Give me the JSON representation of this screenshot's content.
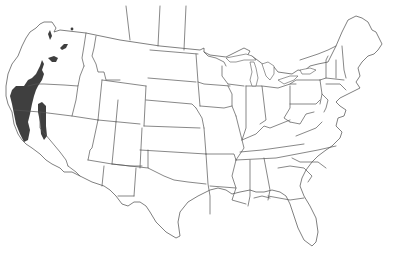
{
  "map": {
    "title": "",
    "region": "Contiguous United States",
    "projection": "Albers-like conic",
    "background_color": "#ffffff",
    "border_color": "#555555",
    "range_color": "#3f3f3f",
    "layers": [
      {
        "name": "state-boundaries",
        "type": "outline"
      },
      {
        "name": "species-range",
        "type": "filled-region"
      }
    ],
    "range_areas": [
      {
        "name": "pacific-coast-range",
        "states": [
          "Washington",
          "Oregon",
          "California"
        ],
        "description": "Coastal band from western Washington through western Oregon into northern California"
      },
      {
        "name": "sierra-nevada-strip",
        "states": [
          "California"
        ],
        "description": "Narrow inland strip in northern California"
      },
      {
        "name": "olympic-cascade-patches",
        "states": [
          "Washington"
        ],
        "description": "Small isolated patches in Washington"
      },
      {
        "name": "columbia-river-patch",
        "states": [
          "Washington",
          "Oregon"
        ],
        "description": "Small patch near the Washington–Oregon border"
      },
      {
        "name": "northern-idaho-dot",
        "states": [
          "Idaho"
        ],
        "description": "Tiny isolated dot near the Canadian border"
      }
    ],
    "legend": null
  }
}
